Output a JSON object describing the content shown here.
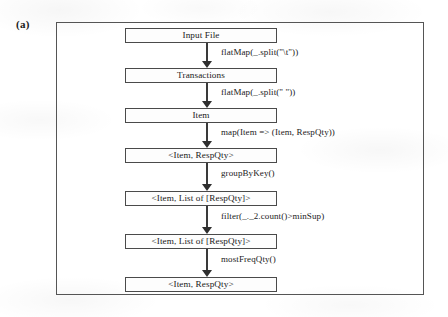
{
  "figure": {
    "panel_label": "(a)",
    "frame": {
      "name": "figure-border"
    }
  },
  "diagram": {
    "type": "flowchart",
    "orientation": "top-to-bottom",
    "nodes": [
      {
        "id": "input-file",
        "label": "Input File",
        "top": 0
      },
      {
        "id": "transactions",
        "label": "Transactions",
        "top": 40
      },
      {
        "id": "item",
        "label": "Item",
        "top": 80
      },
      {
        "id": "item-respqty",
        "label": "<Item, RespQty>",
        "top": 120
      },
      {
        "id": "item-list-respqty-1",
        "label": "<Item, List of [RespQty]>",
        "top": 163
      },
      {
        "id": "item-list-respqty-2",
        "label": "<Item, List of [RespQty]>",
        "top": 206
      },
      {
        "id": "item-respqty-final",
        "label": "<Item, RespQty>",
        "top": 249
      }
    ],
    "edges": [
      {
        "id": "edge-1",
        "from": "input-file",
        "to": "transactions",
        "label": "flatMap(_.split(\"\\t\"))",
        "top": 15,
        "height": 25,
        "label_top": 20
      },
      {
        "id": "edge-2",
        "from": "transactions",
        "to": "item",
        "label": "flatMap(_.split(\" \"))",
        "top": 55,
        "height": 25,
        "label_top": 60
      },
      {
        "id": "edge-3",
        "from": "item",
        "to": "item-respqty",
        "label": "map(Item  => (Item, RespQty))",
        "top": 95,
        "height": 25,
        "label_top": 100
      },
      {
        "id": "edge-4",
        "from": "item-respqty",
        "to": "item-list-respqty-1",
        "label": "groupByKey()",
        "top": 135,
        "height": 28,
        "label_top": 141
      },
      {
        "id": "edge-5",
        "from": "item-list-respqty-1",
        "to": "item-list-respqty-2",
        "label": "filter(_._2.count()>minSup)",
        "top": 178,
        "height": 28,
        "label_top": 184
      },
      {
        "id": "edge-6",
        "from": "item-list-respqty-2",
        "to": "item-respqty-final",
        "label": "mostFreqQty()",
        "top": 221,
        "height": 28,
        "label_top": 227
      }
    ]
  }
}
